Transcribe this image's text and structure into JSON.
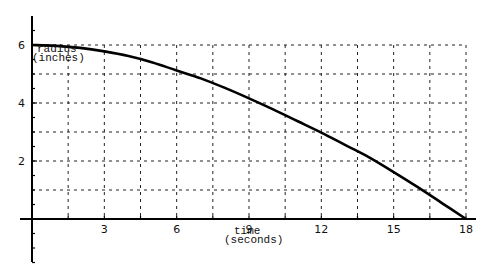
{
  "chart_data": {
    "type": "line",
    "title": "",
    "xlabel": "time\n(seconds)",
    "ylabel": "radius\n(inches)",
    "xlabel_lines": [
      "time",
      "(seconds)"
    ],
    "ylabel_lines": [
      "radius",
      "(inches)"
    ],
    "xlim": [
      0,
      18
    ],
    "ylim": [
      -1.5,
      7
    ],
    "x_ticks": [
      3,
      6,
      9,
      12,
      15,
      18
    ],
    "y_ticks": [
      2,
      4,
      6
    ],
    "grid": true,
    "grid_style": "dashed",
    "legend": null,
    "series": [
      {
        "name": "radius",
        "x": [
          0,
          1,
          2,
          3,
          4,
          5,
          6,
          7,
          8,
          9,
          10,
          11,
          12,
          13,
          14,
          15,
          16,
          17,
          18
        ],
        "values": [
          6.0,
          5.97,
          5.9,
          5.78,
          5.62,
          5.4,
          5.12,
          4.85,
          4.52,
          4.16,
          3.78,
          3.38,
          2.98,
          2.55,
          2.12,
          1.62,
          1.1,
          0.55,
          0.0
        ]
      }
    ]
  }
}
